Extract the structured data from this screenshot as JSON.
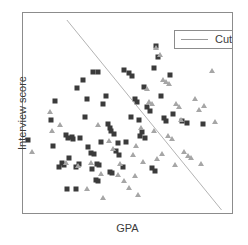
{
  "chart_data": {
    "type": "scatter",
    "title": "",
    "xlabel": "GPA",
    "ylabel": "Interview score",
    "xlim": [
      0,
      100
    ],
    "ylim": [
      0,
      100
    ],
    "grid": false,
    "legend": {
      "position": "top-right",
      "entries": [
        {
          "label": "Cutoff",
          "marker": "line",
          "color": "#9a9a9a"
        }
      ]
    },
    "series": [
      {
        "name": "group-a",
        "marker": "square",
        "color": "#3b3b3b",
        "points": [
          [
            2.5,
            36.5
          ],
          [
            13.5,
            46.5
          ],
          [
            15.5,
            56.0
          ],
          [
            20.5,
            39.0
          ],
          [
            21.5,
            37.5
          ],
          [
            23.5,
            38.0
          ],
          [
            24.0,
            37.0
          ],
          [
            26.0,
            62.5
          ],
          [
            27.5,
            37.5
          ],
          [
            22.0,
            27.5
          ],
          [
            25.5,
            23.0
          ],
          [
            21.0,
            12.0
          ],
          [
            25.5,
            12.0
          ],
          [
            28.5,
            66.5
          ],
          [
            30.5,
            57.0
          ],
          [
            33.5,
            70.5
          ],
          [
            36.0,
            70.5
          ],
          [
            31.0,
            33.0
          ],
          [
            32.5,
            30.0
          ],
          [
            34.0,
            29.5
          ],
          [
            35.5,
            24.5
          ],
          [
            36.5,
            24.0
          ],
          [
            38.5,
            54.5
          ],
          [
            39.5,
            58.5
          ],
          [
            40.5,
            44.5
          ],
          [
            41.5,
            42.5
          ],
          [
            42.0,
            41.0
          ],
          [
            43.5,
            39.5
          ],
          [
            44.5,
            31.0
          ],
          [
            46.0,
            29.0
          ],
          [
            41.5,
            20.5
          ],
          [
            42.5,
            20.0
          ],
          [
            48.5,
            71.5
          ],
          [
            50.5,
            70.0
          ],
          [
            52.0,
            68.5
          ],
          [
            53.5,
            57.0
          ],
          [
            54.5,
            55.5
          ],
          [
            51.5,
            48.0
          ],
          [
            55.5,
            46.5
          ],
          [
            57.0,
            40.5
          ],
          [
            56.0,
            38.5
          ],
          [
            58.5,
            37.5
          ],
          [
            59.5,
            53.0
          ],
          [
            61.0,
            51.0
          ],
          [
            62.5,
            72.5
          ],
          [
            63.5,
            83.5
          ],
          [
            64.5,
            78.0
          ],
          [
            66.0,
            58.5
          ],
          [
            67.5,
            47.5
          ],
          [
            68.5,
            46.0
          ],
          [
            70.5,
            69.0
          ],
          [
            72.0,
            49.5
          ],
          [
            61.5,
            22.5
          ],
          [
            63.0,
            21.0
          ],
          [
            76.0,
            46.0
          ],
          [
            78.5,
            45.0
          ],
          [
            86.0,
            44.5
          ],
          [
            27.0,
            24.5
          ],
          [
            18.5,
            25.0
          ],
          [
            19.5,
            24.0
          ],
          [
            17.0,
            23.0
          ],
          [
            33.0,
            22.0
          ],
          [
            35.0,
            16.5
          ],
          [
            36.0,
            16.0
          ],
          [
            48.0,
            23.0
          ],
          [
            29.5,
            48.0
          ],
          [
            14.5,
            33.5
          ],
          [
            37.5,
            35.5
          ],
          [
            45.5,
            35.0
          ],
          [
            58.0,
            63.0
          ],
          [
            49.5,
            35.5
          ]
        ]
      },
      {
        "name": "group-b",
        "marker": "triangle",
        "color": "#a6a6a6",
        "points": [
          [
            4.5,
            30.5
          ],
          [
            13.0,
            50.5
          ],
          [
            14.0,
            41.0
          ],
          [
            17.5,
            44.0
          ],
          [
            20.5,
            25.0
          ],
          [
            26.5,
            23.5
          ],
          [
            30.5,
            12.0
          ],
          [
            32.5,
            25.0
          ],
          [
            36.0,
            44.0
          ],
          [
            37.5,
            19.5
          ],
          [
            38.5,
            7.5
          ],
          [
            43.0,
            32.0
          ],
          [
            45.5,
            19.0
          ],
          [
            48.5,
            16.0
          ],
          [
            50.5,
            12.5
          ],
          [
            54.0,
            33.5
          ],
          [
            55.0,
            9.0
          ],
          [
            56.5,
            42.5
          ],
          [
            59.5,
            62.0
          ],
          [
            63.5,
            82.5
          ],
          [
            65.5,
            79.0
          ],
          [
            67.0,
            66.5
          ],
          [
            68.5,
            65.5
          ],
          [
            70.0,
            64.5
          ],
          [
            69.5,
            38.5
          ],
          [
            71.5,
            37.0
          ],
          [
            73.0,
            54.5
          ],
          [
            74.5,
            53.0
          ],
          [
            75.5,
            46.5
          ],
          [
            77.0,
            30.5
          ],
          [
            79.0,
            28.5
          ],
          [
            80.5,
            27.5
          ],
          [
            82.5,
            57.0
          ],
          [
            84.0,
            51.5
          ],
          [
            86.5,
            53.5
          ],
          [
            88.0,
            87.5
          ],
          [
            90.5,
            71.0
          ],
          [
            92.0,
            45.5
          ],
          [
            60.5,
            55.5
          ],
          [
            61.5,
            54.5
          ],
          [
            62.5,
            41.0
          ],
          [
            66.5,
            29.5
          ],
          [
            52.5,
            29.0
          ],
          [
            41.0,
            36.0
          ],
          [
            57.5,
            25.5
          ],
          [
            64.0,
            27.0
          ],
          [
            72.5,
            24.0
          ],
          [
            85.0,
            24.5
          ],
          [
            53.5,
            18.5
          ],
          [
            46.5,
            24.5
          ]
        ]
      }
    ],
    "cutoff_line": {
      "label": "Cutoff",
      "color": "#9a9a9a",
      "x1": 21.0,
      "y1": 96.5,
      "x2": 95.0,
      "y2": 1.5
    }
  }
}
